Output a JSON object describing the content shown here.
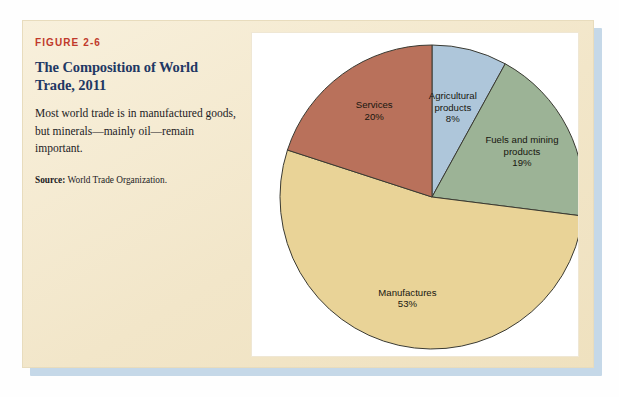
{
  "figure": {
    "number": "FIGURE 2-6",
    "title": "The Composition of World Trade, 2011",
    "description": "Most world trade is in manufactured goods, but minerals—mainly oil—remain important.",
    "source_label": "Source:",
    "source_text": " World Trade Organization."
  },
  "colors": {
    "figure_number": "#c0392b",
    "title": "#1f3864",
    "card_background": "#f5ebd2",
    "panel_background": "#ffffff",
    "shadow": "#c5d8e8"
  },
  "chart_data": {
    "type": "pie",
    "title": "The Composition of World Trade, 2011",
    "categories": [
      "Agricultural products",
      "Fuels and mining products",
      "Manufactures",
      "Services"
    ],
    "values": [
      8,
      19,
      53,
      20
    ],
    "unit": "%",
    "start_angle_deg": 0,
    "direction": "clockwise",
    "legend": "none",
    "labels_inside": true,
    "slices": [
      {
        "name": "Agricultural products",
        "label_line1": "Agricultural",
        "label_line2": "products",
        "value": 8,
        "value_label": "8%",
        "color": "#aec6da"
      },
      {
        "name": "Fuels and mining products",
        "label_line1": "Fuels and mining",
        "label_line2": "products",
        "value": 19,
        "value_label": "19%",
        "color": "#9cb396"
      },
      {
        "name": "Manufactures",
        "label_line1": "Manufactures",
        "label_line2": "",
        "value": 53,
        "value_label": "53%",
        "color": "#e9d397"
      },
      {
        "name": "Services",
        "label_line1": "Services",
        "label_line2": "",
        "value": 20,
        "value_label": "20%",
        "color": "#b9715b"
      }
    ]
  }
}
